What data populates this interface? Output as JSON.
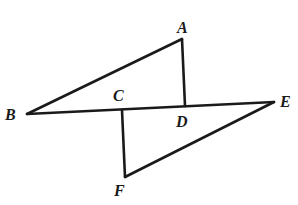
{
  "diagram": {
    "points": {
      "A": {
        "label": "A",
        "x": 182,
        "y": 39,
        "lx": 177,
        "ly": 33
      },
      "B": {
        "label": "B",
        "x": 27,
        "y": 114,
        "lx": 5,
        "ly": 120
      },
      "C": {
        "label": "C",
        "x": 122,
        "y": 110,
        "lx": 113,
        "ly": 101
      },
      "D": {
        "label": "D",
        "x": 185,
        "y": 106,
        "lx": 176,
        "ly": 127
      },
      "E": {
        "label": "E",
        "x": 274,
        "y": 102,
        "lx": 280,
        "ly": 107
      },
      "F": {
        "label": "F",
        "x": 125,
        "y": 177,
        "lx": 114,
        "ly": 196
      }
    },
    "segments": [
      [
        "B",
        "A"
      ],
      [
        "A",
        "D"
      ],
      [
        "B",
        "E"
      ],
      [
        "C",
        "F"
      ],
      [
        "F",
        "E"
      ]
    ],
    "stroke_color": "#1a1a1a"
  }
}
